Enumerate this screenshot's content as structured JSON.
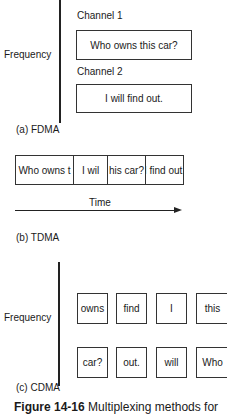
{
  "fdma": {
    "axis_label": "Frequency",
    "channels": [
      {
        "label": "Channel 1",
        "message": "Who owns this car?"
      },
      {
        "label": "Channel 2",
        "message": "I will find out."
      }
    ],
    "caption": "(a) FDMA"
  },
  "tdma": {
    "slots": [
      "Who owns t",
      "I wil",
      "his car?",
      "I find out."
    ],
    "axis_label": "Time",
    "caption": "(b) TDMA"
  },
  "cdma": {
    "axis_label": "Frequency",
    "rows": [
      [
        "owns",
        "find",
        "I",
        "this"
      ],
      [
        "car?",
        "out.",
        "will",
        "Who"
      ]
    ],
    "caption": "(c) CDMA"
  },
  "figure": {
    "number": "Figure 14-16",
    "title": "Multiplexing methods for"
  }
}
